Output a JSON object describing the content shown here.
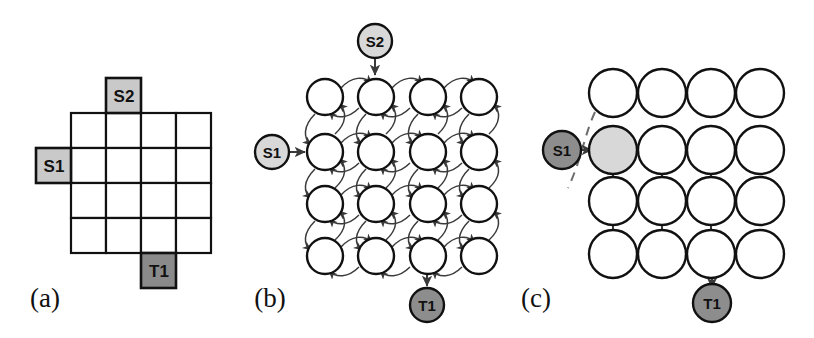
{
  "figure": {
    "width": 814,
    "height": 338,
    "background": "#ffffff"
  },
  "colors": {
    "source_light": "#c9c9c9",
    "source_node_light": "#d8d8d8",
    "target_dark": "#8a8a8a",
    "target_node_dark": "#8d8d8d",
    "open_node": "#ffffff",
    "stroke": "#111111",
    "edge": "#3a3a3a",
    "dashed_edge": "#6d6d6d"
  },
  "panels": [
    {
      "id": "a",
      "caption": "(a)",
      "caption_x": 37,
      "caption_y": 307,
      "type": "grid-map",
      "grid": {
        "origin_x": 71,
        "origin_y": 113,
        "cell": 35,
        "cols": 4,
        "rows": 4
      },
      "boxes": [
        {
          "name": "S2",
          "label": "S2",
          "kind": "source",
          "x": 106,
          "y": 78,
          "w": 35,
          "h": 35
        },
        {
          "name": "S1",
          "label": "S1",
          "kind": "source",
          "x": 36,
          "y": 148,
          "w": 35,
          "h": 35
        },
        {
          "name": "T1",
          "label": "T1",
          "kind": "target",
          "x": 141,
          "y": 253,
          "w": 35,
          "h": 35
        }
      ]
    },
    {
      "id": "b",
      "caption": "(b)",
      "caption_x": 262,
      "caption_y": 307,
      "type": "bidirectional-graph",
      "grid": {
        "origin_x": 325,
        "origin_y": 97,
        "step_x": 51,
        "step_y": 53,
        "cols": 4,
        "rows": 4,
        "radius": 18
      },
      "terminals": [
        {
          "name": "S2",
          "label": "S2",
          "kind": "source",
          "cx": 375,
          "cy": 41,
          "r": 17
        },
        {
          "name": "S1",
          "label": "S1",
          "kind": "source",
          "cx": 272,
          "cy": 152,
          "r": 17
        },
        {
          "name": "T1",
          "label": "T1",
          "kind": "target",
          "cx": 427,
          "cy": 305,
          "r": 17
        }
      ],
      "terminal_edges": [
        {
          "from": "S2",
          "to": "node-r1c2",
          "direction": "down"
        },
        {
          "from": "S1",
          "to": "node-r2c1",
          "direction": "right"
        },
        {
          "from": "node-r4c3",
          "to": "T1",
          "direction": "down"
        }
      ],
      "edge_style": "bidirectional curved pairs between 4-neighbours"
    },
    {
      "id": "c",
      "caption": "(c)",
      "caption_x": 528,
      "caption_y": 307,
      "type": "directed-subgraph",
      "grid": {
        "origin_x": 613,
        "origin_y": 93,
        "step_x": 49,
        "step_y": 53.7,
        "cols": 4,
        "rows": 4,
        "radius": 24
      },
      "highlighted_node": {
        "row": 2,
        "col": 1,
        "fill": "source_node_light"
      },
      "terminals": [
        {
          "name": "S1",
          "label": "S1",
          "kind": "source",
          "cx": 562,
          "cy": 150,
          "r": 19
        },
        {
          "name": "T1",
          "label": "T1",
          "kind": "target",
          "cx": 712,
          "cy": 303,
          "r": 19
        }
      ],
      "directed_edges": [
        {
          "from": "r2c1",
          "to": "r2c2"
        },
        {
          "from": "r2c2",
          "to": "r2c3"
        },
        {
          "from": "r3c1",
          "to": "r3c2"
        },
        {
          "from": "r3c2",
          "to": "r3c3"
        },
        {
          "from": "r4c1",
          "to": "r4c2"
        },
        {
          "from": "r4c2",
          "to": "r4c3"
        },
        {
          "from": "r2c1",
          "to": "r3c1"
        },
        {
          "from": "r3c1",
          "to": "r4c1"
        },
        {
          "from": "r2c2",
          "to": "r3c2"
        },
        {
          "from": "r3c2",
          "to": "r4c2"
        },
        {
          "from": "r2c3",
          "to": "r3c3"
        },
        {
          "from": "r3c3",
          "to": "r4c3"
        },
        {
          "from": "S1",
          "to": "r2c1"
        },
        {
          "from": "r4c3",
          "to": "T1"
        }
      ],
      "dashed_arc": {
        "name": "frontier-arc",
        "path": "M 595,115 C 585,140 582,160 570,186"
      }
    }
  ]
}
